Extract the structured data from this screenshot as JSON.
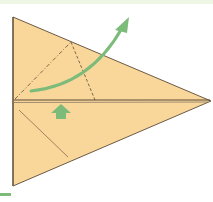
{
  "diagram": {
    "type": "origami-fold-step",
    "colors": {
      "paper": "#f9d79a",
      "paper_edge": "#6b5a44",
      "crease": "#5a4a36",
      "arrow": "#7dbb7a",
      "top_band": "#eef7e6",
      "bottom_tab": "#7dbb7a"
    },
    "shape": {
      "top_left": [
        13,
        17
      ],
      "bottom_left": [
        13,
        186
      ],
      "tip": [
        211,
        101
      ],
      "center_line_y": 101
    },
    "lines": {
      "mountain_fold": {
        "from": [
          15,
          99
        ],
        "to": [
          71,
          42
        ],
        "style": "dash-dot"
      },
      "valley_fold": {
        "from": [
          71,
          42
        ],
        "to": [
          95,
          101
        ],
        "style": "dashed"
      },
      "lower_crease": {
        "from": [
          19,
          110
        ],
        "to": [
          68,
          157
        ],
        "style": "solid"
      }
    },
    "arrows": {
      "curved_fold_arrow": {
        "start": [
          31,
          91
        ],
        "end": [
          128,
          18
        ],
        "meaning": "fold up / flip flap over"
      },
      "push_arrow": {
        "x": 61,
        "y": 104,
        "direction": "up",
        "meaning": "push / squash in"
      }
    }
  }
}
